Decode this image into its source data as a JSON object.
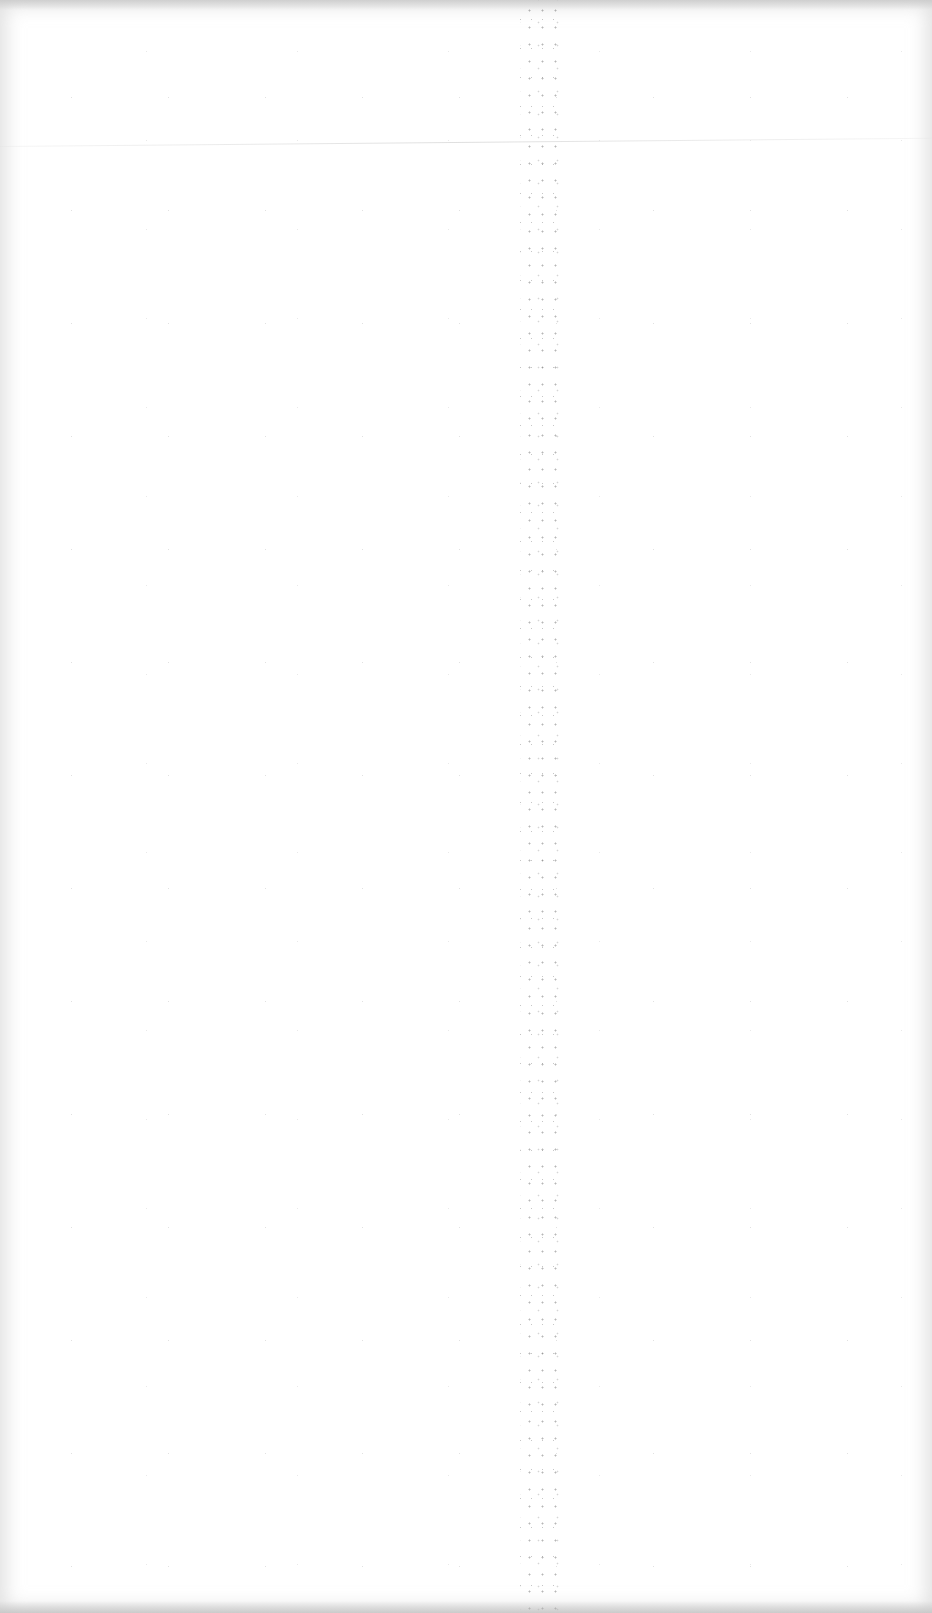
{
  "page": {
    "type": "blank-scanned-page",
    "background_color": "#ffffff",
    "fold_position_x": 535,
    "crease_position_y": 146,
    "text_content": ""
  }
}
